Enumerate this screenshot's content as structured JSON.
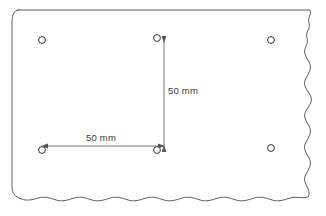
{
  "drawing": {
    "title": "Sheet with hole pattern",
    "background_color": "#ffffff",
    "outline_color": "#4a4a4a",
    "hole_color": "#333333",
    "dimension_color": "#555555",
    "text_color": "#3a3a3a"
  },
  "holes": [
    {
      "name": "hole-top-left",
      "cx": 42,
      "cy": 40,
      "r": 3.4
    },
    {
      "name": "hole-top-middle",
      "cx": 157,
      "cy": 38,
      "r": 3.4
    },
    {
      "name": "hole-top-right",
      "cx": 271,
      "cy": 40,
      "r": 3.4
    },
    {
      "name": "hole-bottom-left",
      "cx": 42,
      "cy": 150,
      "r": 3.4
    },
    {
      "name": "hole-bottom-middle",
      "cx": 157,
      "cy": 150,
      "r": 3.4
    },
    {
      "name": "hole-bottom-right",
      "cx": 271,
      "cy": 148,
      "r": 3.4
    }
  ],
  "dimensions": {
    "vertical": {
      "label": "50 mm",
      "value": 50,
      "unit": "mm",
      "from_hole": "hole-top-middle",
      "to_hole": "hole-bottom-middle"
    },
    "horizontal": {
      "label": "50 mm",
      "value": 50,
      "unit": "mm",
      "from_hole": "hole-bottom-left",
      "to_hole": "hole-bottom-middle"
    }
  },
  "edges": {
    "top": "straight",
    "left": "straight",
    "right": "torn-wavy",
    "bottom": "torn-wavy"
  }
}
